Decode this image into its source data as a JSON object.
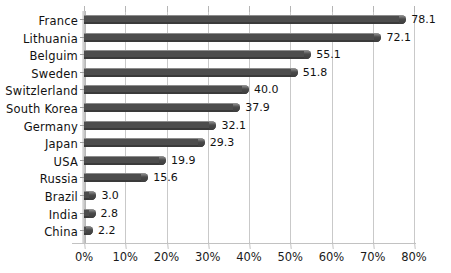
{
  "chart_data": {
    "type": "bar",
    "orientation": "horizontal",
    "title": "",
    "subtitle": "",
    "xlabel": "",
    "ylabel": "",
    "xlim": [
      0,
      80
    ],
    "grid": true,
    "legend": null,
    "xticks": [
      "0%",
      "10%",
      "20%",
      "30%",
      "40%",
      "50%",
      "60%",
      "70%",
      "80%"
    ],
    "xtick_values": [
      0,
      10,
      20,
      30,
      40,
      50,
      60,
      70,
      80
    ],
    "categories": [
      "France",
      "Lithuania",
      "Belguim",
      "Sweden",
      "Switzlerland",
      "South Korea",
      "Germany",
      "Japan",
      "USA",
      "Russia",
      "Brazil",
      "India",
      "China"
    ],
    "values": [
      78.1,
      72.1,
      55.1,
      51.8,
      40.0,
      37.9,
      32.1,
      29.3,
      19.9,
      15.6,
      3.0,
      2.8,
      2.2
    ],
    "value_labels": [
      "78.1",
      "72.1",
      "55.1",
      "51.8",
      "40.0",
      "37.9",
      "32.1",
      "29.3",
      "19.9",
      "15.6",
      "3.0",
      "2.8",
      "2.2"
    ],
    "bar_color": "#4d4d4d",
    "bar_highlight_color": "#8d8d8d",
    "gridline_color": "#c9c9c9",
    "background_color": "#ffffff",
    "text_color": "#111111"
  }
}
